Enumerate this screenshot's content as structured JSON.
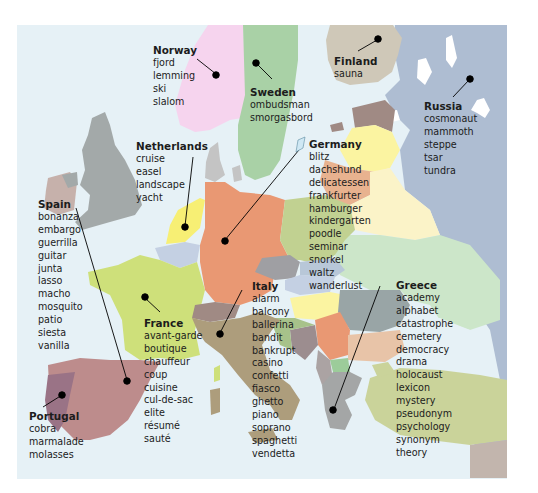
{
  "map": {
    "title": "European loanwords map",
    "colors": {
      "sea": "#e6f1f6",
      "frame_bg": "#ffffff",
      "norway": "#f6d4ee",
      "sweden": "#a9d1a6",
      "finland": "#cfc8b8",
      "russia": "#aebdd2",
      "uk": "#a3a9a9",
      "ireland": "#c6b1ab",
      "netherlands": "#f7ef74",
      "belgium": "#c4d0e3",
      "germany": "#e99873",
      "france": "#cee07a",
      "spain": "#bd8c8c",
      "portugal": "#9a7386",
      "italy": "#ad9d7c",
      "poland": "#c1d191",
      "baltics_yellow": "#fbf4a1",
      "belarus": "#fbf3c8",
      "ukraine": "#cce6c9",
      "greece": "#a4a6a6",
      "turkey": "#cad39a",
      "leader": "#000000"
    }
  },
  "countries": [
    {
      "name": "Norway",
      "words": [
        "fjord",
        "lemming",
        "ski",
        "slalom"
      ]
    },
    {
      "name": "Sweden",
      "words": [
        "ombudsman",
        "smorgasbord"
      ]
    },
    {
      "name": "Finland",
      "words": [
        "sauna"
      ]
    },
    {
      "name": "Russia",
      "words": [
        "cosmonaut",
        "mammoth",
        "steppe",
        "tsar",
        "tundra"
      ]
    },
    {
      "name": "Netherlands",
      "words": [
        "cruise",
        "easel",
        "landscape",
        "yacht"
      ]
    },
    {
      "name": "Germany",
      "words": [
        "blitz",
        "dachshund",
        "delicatessen",
        "frankfurter",
        "hamburger",
        "kindergarten",
        "poodle",
        "seminar",
        "snorkel",
        "waltz",
        "wanderlust"
      ]
    },
    {
      "name": "Spain",
      "words": [
        "bonanza",
        "embargo",
        "guerrilla",
        "guitar",
        "junta",
        "lasso",
        "macho",
        "mosquito",
        "patio",
        "siesta",
        "vanilla"
      ]
    },
    {
      "name": "France",
      "words": [
        "avant-garde",
        "boutique",
        "chauffeur",
        "coup",
        "cuisine",
        "cul-de-sac",
        "elite",
        "résumé",
        "sauté"
      ]
    },
    {
      "name": "Italy",
      "words": [
        "alarm",
        "balcony",
        "ballerina",
        "bandit",
        "bankrupt",
        "casino",
        "confetti",
        "fiasco",
        "ghetto",
        "piano",
        "soprano",
        "spaghetti",
        "vendetta"
      ]
    },
    {
      "name": "Greece",
      "words": [
        "academy",
        "alphabet",
        "catastrophe",
        "cemetery",
        "democracy",
        "drama",
        "holocaust",
        "lexicon",
        "mystery",
        "pseudonym",
        "psychology",
        "synonym",
        "theory"
      ]
    },
    {
      "name": "Portugal",
      "words": [
        "cobra",
        "marmalade",
        "molasses"
      ]
    }
  ]
}
